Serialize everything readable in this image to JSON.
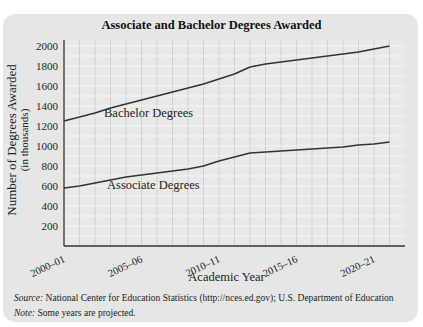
{
  "header_fragment": "mega is a table of data, and the tool compares to the trend of college degree graduates in the Uni...",
  "chart_data": {
    "type": "line",
    "title": "Associate and Bachelor Degrees Awarded",
    "xlabel": "Academic Year",
    "ylabel": "Number of Degrees Awarded",
    "ylabel_sub": "(in thousands)",
    "x_tick_labels": [
      "2000–01",
      "2005–06",
      "2010–11",
      "2015–16",
      "2020–21"
    ],
    "x_tick_positions": [
      0,
      5,
      10,
      15,
      20
    ],
    "y_ticks": [
      200,
      400,
      600,
      800,
      1000,
      1200,
      1400,
      1600,
      1800,
      2000
    ],
    "ylim": [
      0,
      2000
    ],
    "grid": true,
    "x": [
      "2000-01",
      "2001-02",
      "2002-03",
      "2003-04",
      "2004-05",
      "2005-06",
      "2006-07",
      "2007-08",
      "2008-09",
      "2009-10",
      "2010-11",
      "2011-12",
      "2012-13",
      "2013-14",
      "2014-15",
      "2015-16",
      "2016-17",
      "2017-18",
      "2018-19",
      "2019-20",
      "2020-21",
      "2021-22"
    ],
    "series": [
      {
        "name": "Bachelor Degrees",
        "values": [
          1250,
          1290,
          1330,
          1380,
          1420,
          1460,
          1500,
          1540,
          1580,
          1620,
          1670,
          1720,
          1790,
          1820,
          1840,
          1860,
          1880,
          1900,
          1920,
          1940,
          1970,
          2000
        ]
      },
      {
        "name": "Associate Degrees",
        "values": [
          580,
          600,
          630,
          660,
          690,
          710,
          730,
          750,
          770,
          800,
          850,
          890,
          930,
          940,
          950,
          960,
          970,
          980,
          990,
          1010,
          1020,
          1040
        ]
      }
    ],
    "annotations": [
      {
        "text": "Bachelor Degrees",
        "near_series": "Bachelor Degrees"
      },
      {
        "text": "Associate Degrees",
        "near_series": "Associate Degrees"
      }
    ]
  },
  "footer": {
    "source_label": "Source:",
    "source_text": " National Center for Education Statistics (http://nces.ed.gov); U.S. Department of Education",
    "note_label": "Note:",
    "note_text": " Some years are projected."
  },
  "colors": {
    "panel_bg": "#e6e6e6",
    "line": "#333333",
    "grid": "#c8c8c8",
    "grid_h": "#f4f4f4"
  }
}
